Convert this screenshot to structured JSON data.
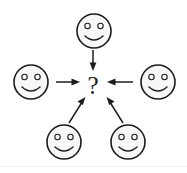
{
  "figure": {
    "background_color": "#ffffff",
    "ink_color": "#1c1c1c",
    "face_fill_color": "#f7f7f7",
    "width": 187,
    "height": 173
  },
  "center": {
    "label": "?",
    "name": "question-mark",
    "x": 93,
    "y": 85
  },
  "nodes": [
    {
      "id": "face-top",
      "icon": "smiley-face-icon",
      "position_label": "top",
      "cx": 94,
      "cy": 31,
      "r": 17
    },
    {
      "id": "face-left",
      "icon": "smiley-face-icon",
      "position_label": "left",
      "cx": 31,
      "cy": 82,
      "r": 17
    },
    {
      "id": "face-right",
      "icon": "smiley-face-icon",
      "position_label": "right",
      "cx": 158,
      "cy": 82,
      "r": 17
    },
    {
      "id": "face-bottom-left",
      "icon": "smiley-face-icon",
      "position_label": "bottom-left",
      "cx": 64,
      "cy": 142,
      "r": 17
    },
    {
      "id": "face-bottom-right",
      "icon": "smiley-face-icon",
      "position_label": "bottom-right",
      "cx": 128,
      "cy": 142,
      "r": 17
    }
  ],
  "arrows": [
    {
      "id": "arrow-top-to-center",
      "from": "face-top",
      "to": "question-mark",
      "direction": "down",
      "x1": 93,
      "y1": 51,
      "x2": 93,
      "y2": 70
    },
    {
      "id": "arrow-left-to-center",
      "from": "face-left",
      "to": "question-mark",
      "direction": "right",
      "x1": 56,
      "y1": 82,
      "x2": 80,
      "y2": 82
    },
    {
      "id": "arrow-right-to-center",
      "from": "face-right",
      "to": "question-mark",
      "direction": "left",
      "x1": 133,
      "y1": 82,
      "x2": 108,
      "y2": 82
    },
    {
      "id": "arrow-bottom-left-to-center",
      "from": "face-bottom-left",
      "to": "question-mark",
      "direction": "up-right",
      "x1": 70,
      "y1": 122,
      "x2": 84,
      "y2": 99
    },
    {
      "id": "arrow-bottom-right-to-center",
      "from": "face-bottom-right",
      "to": "question-mark",
      "direction": "up-left",
      "x1": 122,
      "y1": 122,
      "x2": 106,
      "y2": 99
    }
  ]
}
